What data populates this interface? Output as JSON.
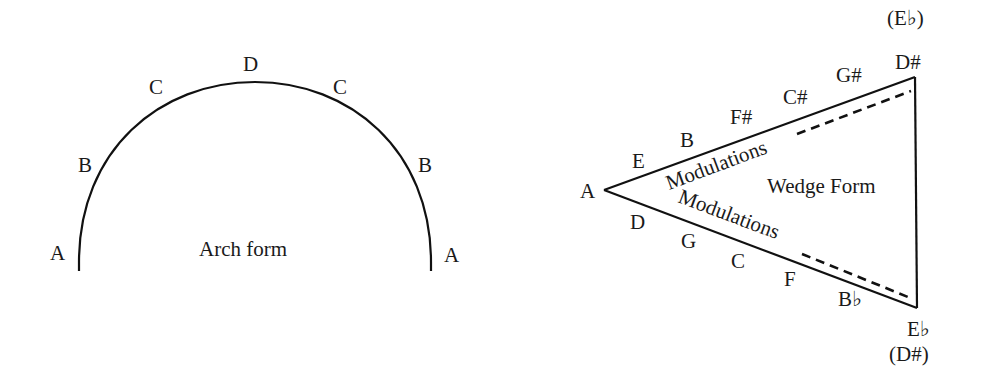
{
  "arch": {
    "title": "Arch form",
    "labels": {
      "left_a": "A",
      "left_b": "B",
      "left_c": "C",
      "top_d": "D",
      "right_c": "C",
      "right_b": "B",
      "right_a": "A"
    }
  },
  "wedge": {
    "title": "Wedge Form",
    "vertex_left": "A",
    "top_vertex": {
      "label": "D#",
      "alt": "(E♭)"
    },
    "bottom_vertex": {
      "label": "E♭",
      "alt": "(D#)"
    },
    "upper_edge": {
      "caption": "Modulations",
      "keys": [
        "E",
        "B",
        "F#",
        "C#",
        "G#"
      ]
    },
    "lower_edge": {
      "caption": "Modulations",
      "keys": [
        "D",
        "G",
        "C",
        "F",
        "B♭"
      ]
    }
  },
  "colors": {
    "ink": "#111111",
    "background": "#ffffff"
  }
}
